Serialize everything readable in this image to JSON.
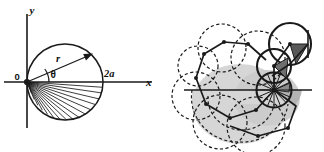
{
  "figure": {
    "background_color": "#ffffff",
    "ink_color": "#1a1a1a",
    "panels": [
      {
        "id": "left",
        "name": "polar-circle-diagram",
        "description": "Circle through origin with polar coordinates r and theta marked, x and y axes, and a fan of chords in the lower half.",
        "labels": {
          "y_axis": "y",
          "x_axis": "x",
          "origin": "0",
          "radius": "r",
          "angle": "θ",
          "diameter": "2a"
        },
        "geometry": {
          "origin_px": [
            27,
            82
          ],
          "circle_center_px": [
            65,
            82
          ],
          "circle_radius_px": 38,
          "x_axis_from_px": [
            4,
            82
          ],
          "x_axis_to_px": [
            152,
            82
          ],
          "y_axis_from_px": [
            27,
            14
          ],
          "y_axis_to_px": [
            27,
            128
          ],
          "r_ray_angle_deg": 36,
          "r_ray_tip_px": [
            92,
            53
          ],
          "theta_arc_radius_px": 22,
          "fan_chord_count": 14,
          "fan_angle_start_deg": -4,
          "fan_angle_end_deg": -92
        }
      },
      {
        "id": "right",
        "name": "spiral-of-circles-diagram",
        "description": "Logarithmic spiral arrangement of tangent circles; upper-right circles drawn solid with dark shaded triangles, lower-left circles drawn dashed over light gray shading, crossed by a horizontal axis line.",
        "labels": {},
        "geometry": {
          "axis_line_from_px": [
            22,
            90
          ],
          "axis_line_to_px": [
            150,
            90
          ],
          "spiral_pole_px": [
            112,
            90
          ],
          "growth_ratio": 0.78,
          "turn_step_deg": 48,
          "circle_count": 11,
          "largest_circle_radius_px": 31
        },
        "colors": {
          "stroke": "#1a1a1a",
          "light_shade": "#d2d2d2",
          "mid_shade": "#a8a8a8",
          "dark_shade": "#6e6e6e",
          "darkest_shade": "#4a4a4a"
        }
      }
    ]
  }
}
